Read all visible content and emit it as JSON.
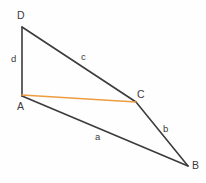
{
  "figure": {
    "background_color": "#fefefe",
    "stroke_color": "#3b3b3b",
    "diagonal_color": "#ed9c3f",
    "stroke_width": 1.6,
    "diagonal_width": 1.6
  },
  "vertices": [
    {
      "name": "D",
      "label": "D",
      "x": 22,
      "y": 27,
      "label_x": 17,
      "label_y": 10
    },
    {
      "name": "A",
      "label": "A",
      "x": 22,
      "y": 96,
      "label_x": 17,
      "label_y": 101
    },
    {
      "name": "C",
      "label": "C",
      "x": 136,
      "y": 102,
      "label_x": 137,
      "label_y": 89
    },
    {
      "name": "B",
      "label": "B",
      "x": 188,
      "y": 166,
      "label_x": 192,
      "label_y": 160
    }
  ],
  "edges": [
    {
      "name": "side-d",
      "label": "d",
      "from": "D",
      "to": "A",
      "label_x": 11,
      "label_y": 54
    },
    {
      "name": "side-c",
      "label": "c",
      "from": "D",
      "to": "C",
      "label_x": 81,
      "label_y": 52
    },
    {
      "name": "side-b",
      "label": "b",
      "from": "C",
      "to": "B",
      "label_x": 163,
      "label_y": 124
    },
    {
      "name": "side-a",
      "label": "a",
      "from": "A",
      "to": "B",
      "label_x": 95,
      "label_y": 132
    }
  ],
  "diagonal": {
    "name": "diagonal-AC",
    "from": "A",
    "to": "C",
    "label": "",
    "color": "#ed9c3f"
  },
  "chart_data": {
    "type": "diagram",
    "points": {
      "D": [
        22,
        27
      ],
      "A": [
        22,
        96
      ],
      "C": [
        136,
        102
      ],
      "B": [
        188,
        166
      ]
    },
    "segments": [
      {
        "label": "d",
        "endpoints": [
          "D",
          "A"
        ],
        "color": "#3b3b3b"
      },
      {
        "label": "c",
        "endpoints": [
          "D",
          "C"
        ],
        "color": "#3b3b3b"
      },
      {
        "label": "b",
        "endpoints": [
          "C",
          "B"
        ],
        "color": "#3b3b3b"
      },
      {
        "label": "a",
        "endpoints": [
          "A",
          "B"
        ],
        "color": "#3b3b3b"
      },
      {
        "label": "",
        "endpoints": [
          "A",
          "C"
        ],
        "color": "#ed9c3f"
      }
    ],
    "xlim": [
      0,
      206
    ],
    "ylim": [
      183,
      0
    ],
    "grid": false,
    "legend": false
  }
}
